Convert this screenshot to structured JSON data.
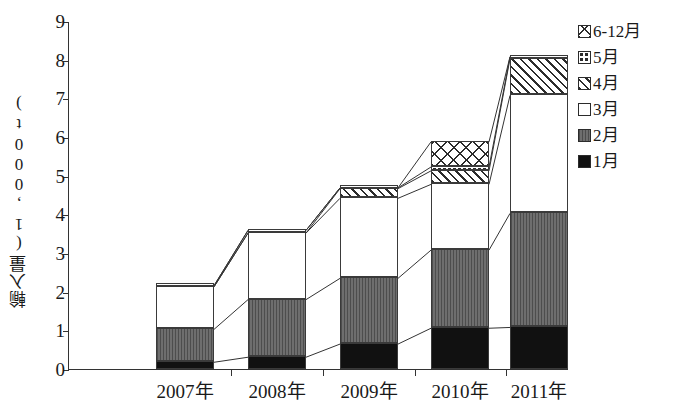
{
  "chart_data": {
    "type": "bar",
    "stacked": true,
    "title": "",
    "xlabel": "",
    "ylabel": "輸入量(1,000t)",
    "ylim": [
      0,
      9
    ],
    "yticks": [
      "0",
      "1",
      "2",
      "3",
      "4",
      "5",
      "6",
      "7",
      "8",
      "9"
    ],
    "grid": false,
    "legend_position": "right",
    "categories": [
      "2007年",
      "2008年",
      "2009年",
      "2010年",
      "2011年"
    ],
    "series": [
      {
        "name": "1月",
        "pattern": "solid-black",
        "values": [
          0.2,
          0.33,
          0.67,
          1.08,
          1.1
        ]
      },
      {
        "name": "2月",
        "pattern": "solid-gray",
        "values": [
          0.85,
          1.49,
          1.7,
          2.02,
          2.95
        ]
      },
      {
        "name": "3月",
        "pattern": "white",
        "values": [
          1.1,
          1.72,
          2.07,
          1.7,
          3.05
        ]
      },
      {
        "name": "4月",
        "pattern": "diagonal",
        "values": [
          0.0,
          0.0,
          0.25,
          0.35,
          0.95
        ]
      },
      {
        "name": "5月",
        "pattern": "dotted",
        "values": [
          0.03,
          0.07,
          0.02,
          0.1,
          0.05
        ]
      },
      {
        "name": "6-12月",
        "pattern": "cross-hatch",
        "values": [
          0.0,
          0.0,
          0.0,
          0.65,
          0.0
        ]
      }
    ],
    "totals": [
      2.18,
      3.61,
      4.71,
      5.9,
      8.1
    ],
    "cumulative": {
      "2007年": [
        0.2,
        1.05,
        2.15,
        2.15,
        2.18,
        2.18
      ],
      "2008年": [
        0.33,
        1.82,
        3.54,
        3.54,
        3.61,
        3.61
      ],
      "2009年": [
        0.67,
        2.37,
        4.44,
        4.69,
        4.71,
        4.71
      ],
      "2010年": [
        1.08,
        3.1,
        4.8,
        5.15,
        5.25,
        5.9
      ],
      "2011年": [
        1.1,
        4.05,
        7.1,
        8.05,
        8.1,
        8.1
      ]
    }
  },
  "legend": {
    "items": [
      {
        "label": "6-12月",
        "swatch": "cross-hatch-swatch"
      },
      {
        "label": "5月",
        "swatch": "dotted-swatch"
      },
      {
        "label": "4月",
        "swatch": "diagonal-swatch"
      },
      {
        "label": "3月",
        "swatch": "white-swatch"
      },
      {
        "label": "2月",
        "swatch": "gray-swatch"
      },
      {
        "label": "1月",
        "swatch": "black-swatch"
      }
    ]
  },
  "colors": {
    "axis": "#333333",
    "black_series": "#111111",
    "gray_series": "#6e6e6e",
    "white_series": "#ffffff",
    "hatch_ink": "#2b2b2b"
  }
}
